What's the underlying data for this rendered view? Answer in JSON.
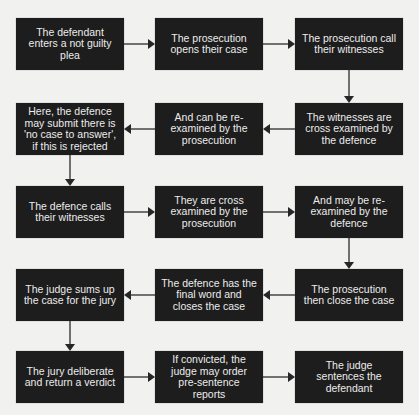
{
  "diagram": {
    "type": "flowchart",
    "title": "",
    "colors": {
      "background": "#f1f1f0",
      "box_fill": "#1d1d1d",
      "box_text": "#ececec",
      "arrow": "#3a3a3a"
    },
    "steps": [
      {
        "id": "s1",
        "text": "The defendant enters a not guilty plea"
      },
      {
        "id": "s2",
        "text": "The prosecution opens their case"
      },
      {
        "id": "s3",
        "text": "The prosecution call their witnesses"
      },
      {
        "id": "s4",
        "text": "The witnesses are cross examined by the defence"
      },
      {
        "id": "s5",
        "text": "And can be re-examined by the prosecution"
      },
      {
        "id": "s6",
        "text": "Here, the defence may submit there is 'no case to answer', if this is rejected"
      },
      {
        "id": "s7",
        "text": "The defence calls their witnesses"
      },
      {
        "id": "s8",
        "text": "They are cross examined by the prosecution"
      },
      {
        "id": "s9",
        "text": "And may be re-examined by the defence"
      },
      {
        "id": "s10",
        "text": "The prosecution then close the case"
      },
      {
        "id": "s11",
        "text": "The defence has the final word and closes the case"
      },
      {
        "id": "s12",
        "text": "The judge sums up the case for the jury"
      },
      {
        "id": "s13",
        "text": "The jury deliberate and return a verdict"
      },
      {
        "id": "s14",
        "text": "If convicted, the judge may order pre-sentence reports"
      },
      {
        "id": "s15",
        "text": "The judge sentences the defendant"
      }
    ],
    "edges": [
      {
        "from": "s1",
        "to": "s2"
      },
      {
        "from": "s2",
        "to": "s3"
      },
      {
        "from": "s3",
        "to": "s4"
      },
      {
        "from": "s4",
        "to": "s5"
      },
      {
        "from": "s5",
        "to": "s6"
      },
      {
        "from": "s6",
        "to": "s7"
      },
      {
        "from": "s7",
        "to": "s8"
      },
      {
        "from": "s8",
        "to": "s9"
      },
      {
        "from": "s9",
        "to": "s10"
      },
      {
        "from": "s10",
        "to": "s11"
      },
      {
        "from": "s11",
        "to": "s12"
      },
      {
        "from": "s12",
        "to": "s13"
      },
      {
        "from": "s13",
        "to": "s14"
      },
      {
        "from": "s14",
        "to": "s15"
      }
    ]
  }
}
